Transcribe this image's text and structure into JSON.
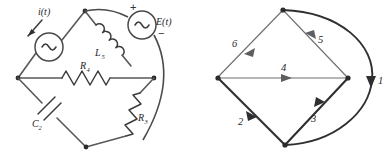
{
  "figure": {
    "width": 389,
    "height": 159,
    "background": "#ffffff"
  },
  "circuit": {
    "name": "bridge-circuit",
    "current_source_label": "i(t)",
    "voltage_source_label": "E(t)",
    "voltage_source_plus": "+",
    "voltage_source_minus": "−",
    "components": [
      {
        "id": "L5",
        "type": "inductor",
        "letter": "L",
        "subscript": "5"
      },
      {
        "id": "R4",
        "type": "resistor",
        "letter": "R",
        "subscript": "4"
      },
      {
        "id": "R3",
        "type": "resistor",
        "letter": "R",
        "subscript": "3"
      },
      {
        "id": "C2",
        "type": "capacitor",
        "letter": "C",
        "subscript": "2"
      }
    ],
    "source_waveform_icon": "sine-wave-icon",
    "arrow_icon": "current-direction-arrow-icon"
  },
  "graph": {
    "name": "oriented-graph",
    "edges": [
      {
        "label": "1",
        "style": "arc",
        "orientation": "downward"
      },
      {
        "label": "2",
        "style": "thick",
        "orientation": "down-right"
      },
      {
        "label": "3",
        "style": "thick",
        "orientation": "up-right"
      },
      {
        "label": "4",
        "style": "thin",
        "orientation": "right"
      },
      {
        "label": "5",
        "style": "thin",
        "orientation": "up-left"
      },
      {
        "label": "6",
        "style": "thin",
        "orientation": "down-left"
      }
    ],
    "nodes": 4
  },
  "colors": {
    "wire": "#58585a",
    "thin_edge": "#6e6e70",
    "thick_edge": "#2f2f31",
    "text": "#262628",
    "background": "#ffffff"
  }
}
